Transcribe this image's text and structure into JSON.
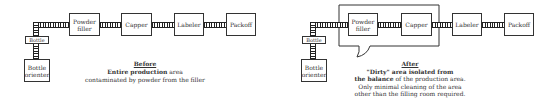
{
  "before": {
    "stations": {
      "powder_filler": "Powder filler",
      "capper": "Capper",
      "labeler": "Labeler",
      "packoff": "Packoff",
      "bottle": "Bottle",
      "bottle_orienter": "Bottle orienter"
    },
    "caption": {
      "title": "Before",
      "line1_bold": "Entire production",
      "line1_rest": " area",
      "line2": "contaminated by powder from the filler"
    }
  },
  "after": {
    "stations": {
      "powder_filler": "Powder filler",
      "capper": "Capper",
      "labeler": "Labeler",
      "packoff": "Packoff",
      "bottle": "Bottle",
      "bottle_orienter": "Bottle orienter"
    },
    "caption": {
      "title": "After",
      "line1": "\"Dirty\" area isolated from",
      "line2_bold": "the balance",
      "line2_rest": " of the production area.",
      "line3": "Only minimal cleaning of the area",
      "line4": "other than the filling room required."
    }
  }
}
